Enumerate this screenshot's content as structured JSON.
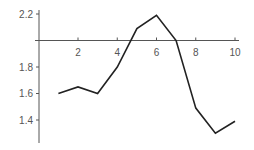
{
  "chart_data": {
    "type": "line",
    "title": "",
    "xlabel": "",
    "ylabel": "",
    "x": [
      1,
      2,
      3,
      4,
      5,
      6,
      7,
      8,
      9,
      10
    ],
    "series": [
      {
        "name": "series-1",
        "values": [
          1.6,
          1.65,
          1.6,
          1.8,
          2.09,
          2.19,
          2.0,
          1.49,
          1.3,
          1.39
        ]
      }
    ],
    "xticks": [
      2,
      4,
      6,
      8,
      10
    ],
    "xtick_labels": [
      "2",
      "4",
      "6",
      "8",
      "10"
    ],
    "yticks": [
      1.4,
      1.6,
      1.8,
      2.2
    ],
    "ytick_labels": [
      "1.4",
      "1.6",
      "1.8",
      "2.2"
    ],
    "xlim": [
      0,
      10.2
    ],
    "ylim": [
      1.2,
      2.25
    ],
    "x_axis_at_y": 2.0,
    "grid": false,
    "legend": "none",
    "colors": {
      "line": "#222222",
      "axis": "#555555",
      "text": "#555555"
    }
  }
}
